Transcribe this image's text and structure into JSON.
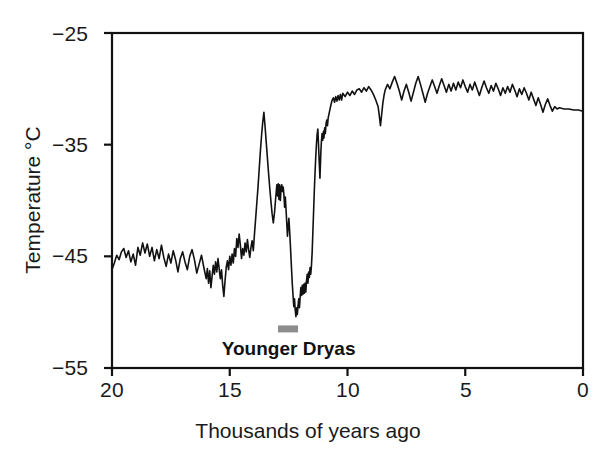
{
  "chart_data": {
    "type": "line",
    "title": "",
    "subtitle": "",
    "xlabel": "Thousands of years ago",
    "ylabel": "Temperature °C",
    "xlim": [
      20,
      0
    ],
    "ylim": [
      -55,
      -25
    ],
    "x_reversed": true,
    "grid": false,
    "legend": null,
    "xticks": [
      20,
      15,
      10,
      5,
      0
    ],
    "xtick_labels": [
      "20",
      "15",
      "10",
      "5",
      "0"
    ],
    "yticks": [
      -25,
      -35,
      -45,
      -55
    ],
    "ytick_labels": [
      "−25",
      "−35",
      "−45",
      "−55"
    ],
    "line_color": "#111111",
    "line_width": 1.6,
    "background": "#ffffff",
    "annotations": [
      {
        "name": "younger-dryas",
        "label": "Younger Dryas",
        "type": "interval-bar",
        "x_start": 12.95,
        "x_end": 12.1,
        "y": -51.5,
        "bar_color": "#8c8c8c",
        "label_x": 12.5,
        "label_y": -53.0
      }
    ],
    "series": [
      {
        "name": "GISP2 ice-core temperature",
        "color": "#111111",
        "points": [
          [
            20.0,
            -46.2
          ],
          [
            19.9,
            -45.6
          ],
          [
            19.8,
            -44.9
          ],
          [
            19.7,
            -45.3
          ],
          [
            19.6,
            -44.6
          ],
          [
            19.5,
            -44.3
          ],
          [
            19.4,
            -45.1
          ],
          [
            19.3,
            -44.5
          ],
          [
            19.2,
            -45.5
          ],
          [
            19.1,
            -44.8
          ],
          [
            19.0,
            -45.8
          ],
          [
            18.9,
            -44.2
          ],
          [
            18.8,
            -44.9
          ],
          [
            18.7,
            -43.8
          ],
          [
            18.6,
            -44.7
          ],
          [
            18.5,
            -43.9
          ],
          [
            18.4,
            -45.0
          ],
          [
            18.3,
            -44.2
          ],
          [
            18.2,
            -45.4
          ],
          [
            18.1,
            -44.4
          ],
          [
            18.0,
            -45.2
          ],
          [
            17.9,
            -44.0
          ],
          [
            17.8,
            -45.1
          ],
          [
            17.7,
            -45.9
          ],
          [
            17.6,
            -44.8
          ],
          [
            17.5,
            -45.6
          ],
          [
            17.4,
            -44.5
          ],
          [
            17.3,
            -45.3
          ],
          [
            17.2,
            -46.4
          ],
          [
            17.1,
            -45.2
          ],
          [
            17.0,
            -44.6
          ],
          [
            16.9,
            -45.5
          ],
          [
            16.8,
            -46.2
          ],
          [
            16.7,
            -45.0
          ],
          [
            16.6,
            -44.4
          ],
          [
            16.5,
            -45.3
          ],
          [
            16.4,
            -46.5
          ],
          [
            16.3,
            -45.7
          ],
          [
            16.2,
            -44.9
          ],
          [
            16.1,
            -46.0
          ],
          [
            16.0,
            -47.0
          ],
          [
            15.95,
            -46.1
          ],
          [
            15.9,
            -47.4
          ],
          [
            15.85,
            -46.3
          ],
          [
            15.8,
            -47.8
          ],
          [
            15.75,
            -46.8
          ],
          [
            15.7,
            -45.8
          ],
          [
            15.65,
            -46.6
          ],
          [
            15.6,
            -45.5
          ],
          [
            15.55,
            -46.4
          ],
          [
            15.5,
            -45.2
          ],
          [
            15.45,
            -46.1
          ],
          [
            15.4,
            -47.0
          ],
          [
            15.35,
            -46.2
          ],
          [
            15.3,
            -47.6
          ],
          [
            15.25,
            -48.6
          ],
          [
            15.2,
            -47.2
          ],
          [
            15.15,
            -46.0
          ],
          [
            15.1,
            -45.4
          ],
          [
            15.05,
            -46.2
          ],
          [
            15.0,
            -45.0
          ],
          [
            14.95,
            -45.8
          ],
          [
            14.9,
            -44.8
          ],
          [
            14.85,
            -45.6
          ],
          [
            14.8,
            -44.3
          ],
          [
            14.75,
            -45.0
          ],
          [
            14.7,
            -43.4
          ],
          [
            14.65,
            -44.2
          ],
          [
            14.6,
            -43.0
          ],
          [
            14.55,
            -44.0
          ],
          [
            14.5,
            -45.2
          ],
          [
            14.45,
            -44.3
          ],
          [
            14.4,
            -44.9
          ],
          [
            14.35,
            -43.8
          ],
          [
            14.3,
            -44.6
          ],
          [
            14.25,
            -43.5
          ],
          [
            14.2,
            -44.4
          ],
          [
            14.15,
            -45.1
          ],
          [
            14.1,
            -44.2
          ],
          [
            14.05,
            -43.6
          ],
          [
            14.0,
            -44.5
          ],
          [
            13.95,
            -43.0
          ],
          [
            13.9,
            -41.6
          ],
          [
            13.85,
            -40.2
          ],
          [
            13.8,
            -38.8
          ],
          [
            13.75,
            -37.2
          ],
          [
            13.7,
            -35.6
          ],
          [
            13.65,
            -34.2
          ],
          [
            13.6,
            -33.0
          ],
          [
            13.55,
            -32.1
          ],
          [
            13.5,
            -33.4
          ],
          [
            13.45,
            -34.8
          ],
          [
            13.4,
            -36.2
          ],
          [
            13.35,
            -37.6
          ],
          [
            13.3,
            -38.9
          ],
          [
            13.25,
            -40.1
          ],
          [
            13.2,
            -41.2
          ],
          [
            13.15,
            -42.0
          ],
          [
            13.1,
            -41.1
          ],
          [
            13.05,
            -39.8
          ],
          [
            13.0,
            -38.6
          ],
          [
            12.97,
            -39.6
          ],
          [
            12.94,
            -38.5
          ],
          [
            12.91,
            -39.9
          ],
          [
            12.88,
            -38.6
          ],
          [
            12.85,
            -40.0
          ],
          [
            12.82,
            -38.9
          ],
          [
            12.79,
            -38.6
          ],
          [
            12.76,
            -39.2
          ],
          [
            12.73,
            -38.8
          ],
          [
            12.7,
            -39.5
          ],
          [
            12.67,
            -40.6
          ],
          [
            12.64,
            -39.7
          ],
          [
            12.61,
            -40.8
          ],
          [
            12.58,
            -42.0
          ],
          [
            12.55,
            -43.2
          ],
          [
            12.52,
            -42.4
          ],
          [
            12.49,
            -41.6
          ],
          [
            12.46,
            -42.6
          ],
          [
            12.43,
            -43.8
          ],
          [
            12.4,
            -45.1
          ],
          [
            12.37,
            -46.4
          ],
          [
            12.34,
            -47.6
          ],
          [
            12.31,
            -48.6
          ],
          [
            12.28,
            -49.5
          ],
          [
            12.25,
            -48.8
          ],
          [
            12.22,
            -49.8
          ],
          [
            12.19,
            -50.4
          ],
          [
            12.16,
            -49.6
          ],
          [
            12.13,
            -50.2
          ],
          [
            12.1,
            -49.4
          ],
          [
            12.07,
            -48.8
          ],
          [
            12.04,
            -49.6
          ],
          [
            12.01,
            -48.6
          ],
          [
            11.98,
            -47.8
          ],
          [
            11.95,
            -48.5
          ],
          [
            11.92,
            -47.6
          ],
          [
            11.89,
            -48.4
          ],
          [
            11.86,
            -47.5
          ],
          [
            11.83,
            -48.3
          ],
          [
            11.8,
            -47.4
          ],
          [
            11.77,
            -48.2
          ],
          [
            11.74,
            -47.2
          ],
          [
            11.71,
            -46.6
          ],
          [
            11.68,
            -47.4
          ],
          [
            11.65,
            -46.4
          ],
          [
            11.62,
            -46.9
          ],
          [
            11.59,
            -46.0
          ],
          [
            11.56,
            -46.6
          ],
          [
            11.53,
            -45.8
          ],
          [
            11.5,
            -44.6
          ],
          [
            11.47,
            -42.8
          ],
          [
            11.44,
            -41.0
          ],
          [
            11.41,
            -39.2
          ],
          [
            11.38,
            -37.6
          ],
          [
            11.35,
            -36.2
          ],
          [
            11.32,
            -35.0
          ],
          [
            11.29,
            -34.1
          ],
          [
            11.26,
            -33.6
          ],
          [
            11.23,
            -35.0
          ],
          [
            11.2,
            -36.6
          ],
          [
            11.17,
            -38.0
          ],
          [
            11.15,
            -36.8
          ],
          [
            11.13,
            -35.6
          ],
          [
            11.11,
            -34.8
          ],
          [
            11.08,
            -34.0
          ],
          [
            11.05,
            -34.6
          ],
          [
            11.02,
            -33.8
          ],
          [
            11.0,
            -34.4
          ],
          [
            10.97,
            -33.5
          ],
          [
            10.94,
            -34.0
          ],
          [
            10.91,
            -33.1
          ],
          [
            10.88,
            -32.8
          ],
          [
            10.85,
            -33.3
          ],
          [
            10.82,
            -32.6
          ],
          [
            10.78,
            -32.2
          ],
          [
            10.74,
            -31.8
          ],
          [
            10.7,
            -31.4
          ],
          [
            10.65,
            -31.0
          ],
          [
            10.6,
            -30.8
          ],
          [
            10.55,
            -31.2
          ],
          [
            10.5,
            -30.7
          ],
          [
            10.45,
            -31.1
          ],
          [
            10.4,
            -30.6
          ],
          [
            10.35,
            -31.0
          ],
          [
            10.3,
            -30.5
          ],
          [
            10.25,
            -31.0
          ],
          [
            10.2,
            -30.4
          ],
          [
            10.1,
            -30.7
          ],
          [
            10.0,
            -30.3
          ],
          [
            9.9,
            -30.6
          ],
          [
            9.8,
            -30.2
          ],
          [
            9.7,
            -30.5
          ],
          [
            9.6,
            -30.1
          ],
          [
            9.5,
            -30.0
          ],
          [
            9.4,
            -30.3
          ],
          [
            9.3,
            -29.9
          ],
          [
            9.2,
            -30.2
          ],
          [
            9.1,
            -29.8
          ],
          [
            9.0,
            -30.1
          ],
          [
            8.9,
            -30.5
          ],
          [
            8.8,
            -31.0
          ],
          [
            8.7,
            -31.6
          ],
          [
            8.65,
            -32.4
          ],
          [
            8.6,
            -33.3
          ],
          [
            8.55,
            -32.3
          ],
          [
            8.5,
            -31.3
          ],
          [
            8.45,
            -30.6
          ],
          [
            8.4,
            -30.1
          ],
          [
            8.3,
            -29.6
          ],
          [
            8.2,
            -30.0
          ],
          [
            8.1,
            -29.4
          ],
          [
            8.0,
            -28.9
          ],
          [
            7.9,
            -29.5
          ],
          [
            7.8,
            -30.2
          ],
          [
            7.7,
            -31.0
          ],
          [
            7.6,
            -30.2
          ],
          [
            7.5,
            -29.6
          ],
          [
            7.4,
            -30.3
          ],
          [
            7.3,
            -31.1
          ],
          [
            7.2,
            -30.3
          ],
          [
            7.1,
            -29.5
          ],
          [
            7.0,
            -28.9
          ],
          [
            6.9,
            -29.6
          ],
          [
            6.8,
            -30.4
          ],
          [
            6.7,
            -31.2
          ],
          [
            6.6,
            -30.4
          ],
          [
            6.5,
            -29.8
          ],
          [
            6.4,
            -29.2
          ],
          [
            6.3,
            -29.8
          ],
          [
            6.2,
            -30.4
          ],
          [
            6.1,
            -29.7
          ],
          [
            6.0,
            -29.1
          ],
          [
            5.9,
            -29.7
          ],
          [
            5.8,
            -30.3
          ],
          [
            5.7,
            -29.6
          ],
          [
            5.6,
            -30.2
          ],
          [
            5.5,
            -29.5
          ],
          [
            5.4,
            -30.1
          ],
          [
            5.3,
            -29.4
          ],
          [
            5.2,
            -29.9
          ],
          [
            5.1,
            -29.2
          ],
          [
            5.0,
            -29.8
          ],
          [
            4.9,
            -30.3
          ],
          [
            4.8,
            -29.6
          ],
          [
            4.7,
            -30.1
          ],
          [
            4.6,
            -29.4
          ],
          [
            4.5,
            -30.0
          ],
          [
            4.4,
            -30.6
          ],
          [
            4.3,
            -29.9
          ],
          [
            4.2,
            -29.3
          ],
          [
            4.1,
            -29.9
          ],
          [
            4.0,
            -30.4
          ],
          [
            3.9,
            -29.7
          ],
          [
            3.8,
            -30.2
          ],
          [
            3.7,
            -29.5
          ],
          [
            3.6,
            -30.0
          ],
          [
            3.5,
            -30.6
          ],
          [
            3.4,
            -29.9
          ],
          [
            3.3,
            -30.4
          ],
          [
            3.2,
            -29.8
          ],
          [
            3.1,
            -30.3
          ],
          [
            3.0,
            -29.6
          ],
          [
            2.9,
            -30.1
          ],
          [
            2.8,
            -30.7
          ],
          [
            2.7,
            -30.0
          ],
          [
            2.6,
            -30.5
          ],
          [
            2.5,
            -29.9
          ],
          [
            2.4,
            -30.4
          ],
          [
            2.3,
            -31.0
          ],
          [
            2.2,
            -30.3
          ],
          [
            2.1,
            -30.9
          ],
          [
            2.0,
            -31.5
          ],
          [
            1.9,
            -30.8
          ],
          [
            1.8,
            -31.4
          ],
          [
            1.7,
            -32.1
          ],
          [
            1.6,
            -31.4
          ],
          [
            1.5,
            -30.9
          ],
          [
            1.4,
            -31.5
          ],
          [
            1.3,
            -32.0
          ],
          [
            1.2,
            -31.6
          ],
          [
            1.1,
            -31.8
          ],
          [
            1.0,
            -31.7
          ],
          [
            0.8,
            -31.8
          ],
          [
            0.6,
            -31.8
          ],
          [
            0.4,
            -31.9
          ],
          [
            0.2,
            -31.9
          ],
          [
            0.0,
            -32.0
          ]
        ]
      }
    ]
  },
  "axes": {
    "y_label": "Temperature °C",
    "x_label": "Thousands of years ago",
    "ytick_labels": [
      "−25",
      "−35",
      "−45",
      "−55"
    ],
    "xtick_labels": [
      "20",
      "15",
      "10",
      "5",
      "0"
    ]
  },
  "annotation": {
    "younger_dryas_label": "Younger Dryas"
  }
}
